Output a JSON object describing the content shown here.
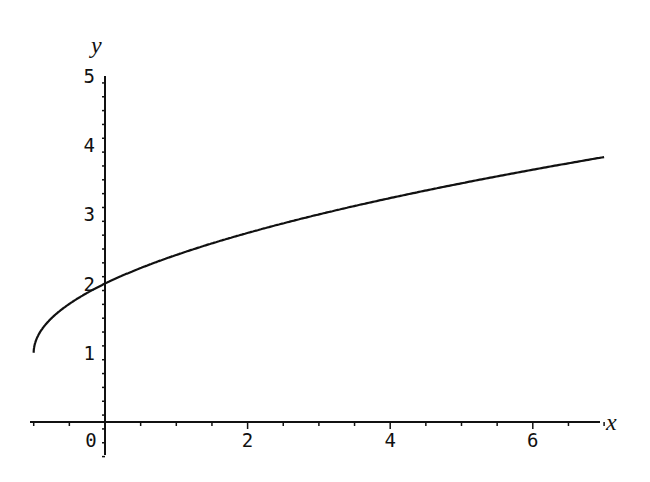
{
  "chart_data": {
    "type": "line",
    "title": "",
    "xlabel": "x",
    "ylabel": "y",
    "xlim": [
      -1.05,
      7
    ],
    "ylim": [
      -0.5,
      5
    ],
    "grid": false,
    "legend": null,
    "x_ticks": [
      "0",
      "2",
      "4",
      "6"
    ],
    "y_ticks": [
      "1",
      "2",
      "3",
      "4",
      "5"
    ],
    "series": [
      {
        "name": "y = sqrt(x+1) + 1",
        "x": [
          -1,
          -0.9,
          -0.75,
          -0.5,
          0,
          0.5,
          1,
          1.5,
          2,
          3,
          4,
          5,
          6,
          7
        ],
        "values": [
          1,
          1.32,
          1.5,
          1.71,
          2,
          2.22,
          2.41,
          2.58,
          2.73,
          3,
          3.24,
          3.45,
          3.65,
          3.83
        ]
      }
    ],
    "color": "#111111"
  }
}
